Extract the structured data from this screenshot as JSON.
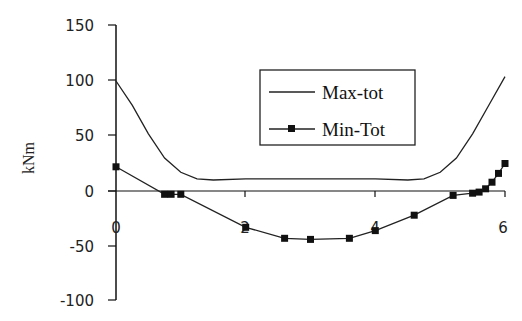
{
  "chart_data": {
    "type": "line",
    "title": "",
    "xlabel": "",
    "ylabel": "kNm",
    "xlim": [
      0,
      6
    ],
    "ylim": [
      -100,
      150
    ],
    "x_ticks": [
      "0",
      "2",
      "4",
      "6"
    ],
    "y_ticks": [
      "150",
      "100",
      "50",
      "0",
      "-50",
      "-100"
    ],
    "grid": false,
    "legend_position": "upper-right-inside",
    "series": [
      {
        "name": "Max-tot",
        "marker": "none",
        "x": [
          0,
          0.25,
          0.5,
          0.75,
          1.0,
          1.25,
          1.5,
          2.0,
          2.5,
          3.0,
          3.5,
          4.0,
          4.5,
          4.75,
          5.0,
          5.25,
          5.5,
          5.75,
          6.0
        ],
        "y": [
          100,
          78,
          52,
          30,
          17,
          11,
          10,
          11,
          11,
          11,
          11,
          11,
          10,
          11,
          17,
          30,
          52,
          78,
          104
        ]
      },
      {
        "name": "Min-Tot",
        "marker": "square",
        "x": [
          0,
          0.75,
          0.85,
          1.0,
          2.0,
          2.6,
          3.0,
          3.6,
          4.0,
          4.6,
          5.2,
          5.5,
          5.6,
          5.7,
          5.8,
          5.9,
          6.0
        ],
        "y": [
          22,
          -3,
          -3,
          -3,
          -33,
          -43,
          -44,
          -43,
          -36,
          -22,
          -4,
          -2,
          -1,
          2,
          8,
          16,
          25
        ]
      }
    ]
  },
  "labels": {
    "y_title": "kNm",
    "legend_max": "Max-tot",
    "legend_min": "Min-Tot",
    "y150": "150",
    "y100": "100",
    "y50": "50",
    "y0": "0",
    "ym50": "-50",
    "ym100": "-100",
    "x0": "0",
    "x2": "2",
    "x4": "4",
    "x6": "6"
  }
}
